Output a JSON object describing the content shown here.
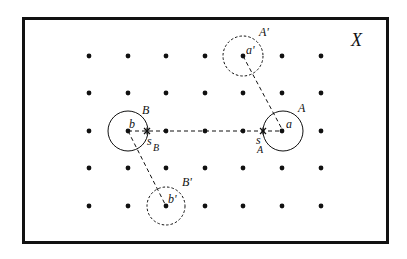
{
  "diagram": {
    "space_label": "X",
    "frame": {
      "x": 23,
      "y": 18,
      "width": 365,
      "height": 225
    },
    "grid": {
      "columns_x": [
        89,
        128,
        166,
        205,
        243,
        282,
        321
      ],
      "rows_y": [
        56,
        93,
        131,
        168,
        206
      ]
    },
    "regions": [
      {
        "name": "A",
        "label": "A",
        "point_label": "a",
        "center": [
          283,
          131
        ],
        "radius": 20,
        "style": "solid"
      },
      {
        "name": "B",
        "label": "B",
        "point_label": "b",
        "center": [
          128,
          131
        ],
        "radius": 20,
        "style": "solid"
      },
      {
        "name": "A-prime",
        "label": "A'",
        "point_label": "a'",
        "center": [
          243,
          56
        ],
        "radius": 20,
        "style": "dashed"
      },
      {
        "name": "B-prime",
        "label": "B'",
        "point_label": "b'",
        "center": [
          166,
          206
        ],
        "radius": 19,
        "style": "dashed"
      }
    ],
    "boundary_points": [
      {
        "name": "s_A",
        "label": "s",
        "subscript": "A",
        "position": [
          263,
          131
        ]
      },
      {
        "name": "s_B",
        "label": "s",
        "subscript": "B",
        "position": [
          147,
          131
        ]
      }
    ],
    "connections": [
      {
        "from": "b",
        "to": "a",
        "style": "dashed"
      },
      {
        "from": "a'",
        "to": "a",
        "style": "dashed"
      },
      {
        "from": "b",
        "to": "b'",
        "style": "dashed"
      }
    ]
  }
}
